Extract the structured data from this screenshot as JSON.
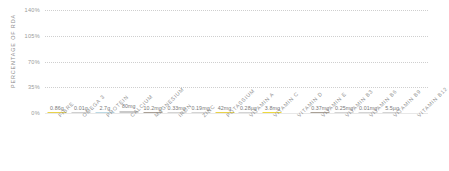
{
  "chart_data": {
    "type": "bar",
    "title": "",
    "xlabel": "",
    "ylabel": "PERCENTAGE OF RDA",
    "ylim": [
      0,
      140
    ],
    "yticks": [
      "0%",
      "35%",
      "70%",
      "105%",
      "140%"
    ],
    "ytick_values": [
      0,
      35,
      70,
      105,
      140
    ],
    "grid": true,
    "legend": "none",
    "categories": [
      "FIBRE",
      "OMEGA 3",
      "PROTEIN",
      "CALCIUM",
      "MAGNESIUM",
      "IRON",
      "ZINC",
      "POTASSIUM",
      "VITAMIN A",
      "VITAMIN C",
      "VITAMIN D",
      "VITAMIN E",
      "VITAMIN B3",
      "VITAMIN B6",
      "VITAMIN B9",
      "VITAMIN B12"
    ],
    "values": [
      1.2,
      0.8,
      1.6,
      3.2,
      1.2,
      0.8,
      0.8,
      1.0,
      0.8,
      1.4,
      0,
      1.2,
      1.0,
      0.8,
      0.8,
      0.8
    ],
    "data_labels": [
      "0.86g",
      "0.01g",
      "2.7g",
      "80mg",
      "10.2mg",
      "0.33mg",
      "0.19mg",
      "42mg",
      "0.28µg",
      "3.8mg",
      "",
      "0.37mg",
      "0.25mg",
      "0.01mg",
      "5.5µg",
      ""
    ],
    "bar_colors": [
      "#e8d24a",
      "#cfcfcf",
      "#bcd9e4",
      "#c9c9c9",
      "#a9a096",
      "#d4d4d4",
      "#d4d4d4",
      "#e8d24a",
      "#d4d4d4",
      "#edd93f",
      "#ffffff",
      "#a9a096",
      "#d4d4d4",
      "#d4d4d4",
      "#d4d4d4",
      "#ffffff"
    ]
  },
  "colors": {
    "grid": "#cfcfcf",
    "axis_text": "#9a9a9a",
    "label_text": "#777777",
    "category_text": "#8e8e8e",
    "background": "#ffffff"
  }
}
